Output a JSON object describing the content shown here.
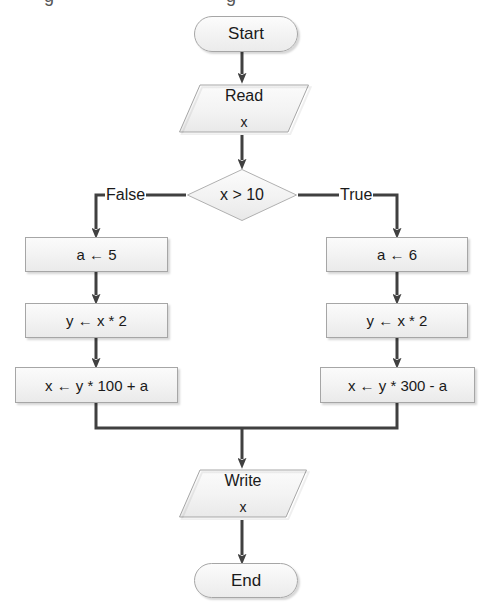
{
  "diagram": {
    "type": "flowchart",
    "title": "",
    "nodes": [
      {
        "id": "start",
        "shape": "terminator",
        "text": "Start"
      },
      {
        "id": "read",
        "shape": "input-output",
        "text": "Read",
        "sub": "x"
      },
      {
        "id": "cond",
        "shape": "decision",
        "text": "x > 10"
      },
      {
        "id": "a5",
        "shape": "process",
        "text": "a ← 5"
      },
      {
        "id": "a6",
        "shape": "process",
        "text": "a ← 6"
      },
      {
        "id": "yl",
        "shape": "process",
        "text": "y ← x * 2"
      },
      {
        "id": "yr",
        "shape": "process",
        "text": "y ← x * 2"
      },
      {
        "id": "xl",
        "shape": "process",
        "text": "x ← y * 100 + a"
      },
      {
        "id": "xr",
        "shape": "process",
        "text": "x ← y * 300 - a"
      },
      {
        "id": "write",
        "shape": "input-output",
        "text": "Write",
        "sub": "x"
      },
      {
        "id": "end",
        "shape": "terminator",
        "text": "End"
      }
    ],
    "edge_labels": {
      "false": "False",
      "true": "True"
    },
    "colors": {
      "shape_fill": "#f3f3f3",
      "shape_border": "#a6a6a6",
      "connector": "#404040",
      "text": "#1a1a1a",
      "background": "#ffffff"
    }
  }
}
